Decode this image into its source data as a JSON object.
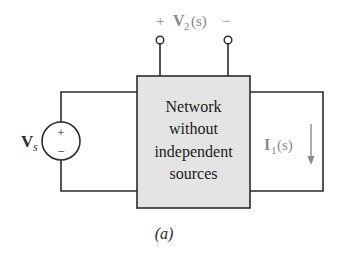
{
  "figure": {
    "caption": "(a)"
  },
  "source": {
    "label_main": "V",
    "label_sub": "s",
    "plus": "+",
    "minus": "−"
  },
  "network": {
    "lines": [
      "Network",
      "without",
      "independent",
      "sources"
    ],
    "fill": "#e4e4e4"
  },
  "output_voltage": {
    "plus": "+",
    "label_main": "V",
    "label_sub": "2",
    "label_arg": "(s)",
    "minus": "−"
  },
  "output_current": {
    "label_main": "I",
    "label_sub": "1",
    "label_arg": "(s)"
  },
  "colors": {
    "wire": "#2b2b2b",
    "muted_label": "#8a8a8a",
    "box_fill": "#e4e4e4"
  }
}
